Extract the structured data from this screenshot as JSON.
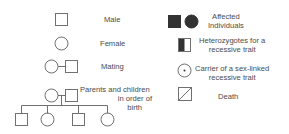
{
  "legend": {
    "left": [
      {
        "symbol": "square-icon",
        "label": "Male"
      },
      {
        "symbol": "circle-icon",
        "label": "Female"
      },
      {
        "symbol": "mating-icon",
        "label": "Mating"
      },
      {
        "symbol": "family-icon",
        "label_lines": [
          "Parents and children",
          "in order of",
          "birth"
        ]
      }
    ],
    "right": [
      {
        "symbol": "affected-icon",
        "label_lines": [
          "Affected",
          "Individuals"
        ]
      },
      {
        "symbol": "heterozygote-icon",
        "label_lines": [
          "Heterozygotes for a",
          "recessive trait"
        ]
      },
      {
        "symbol": "carrier-icon",
        "label_lines": [
          "Carrier of a sex-linked",
          "recessive trait"
        ]
      },
      {
        "symbol": "death-icon",
        "label": "Death"
      }
    ]
  },
  "colors": {
    "stroke": "#707070",
    "fill": "#333333",
    "text": "#4a4a4a",
    "background": "#ffffff"
  }
}
